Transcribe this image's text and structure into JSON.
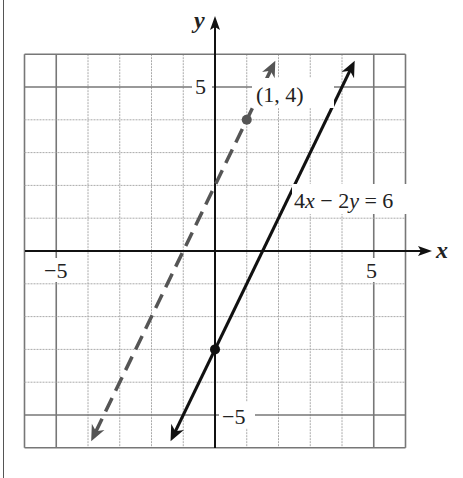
{
  "chart_data": {
    "type": "line",
    "title": "",
    "xlabel": "x",
    "ylabel": "y",
    "xlim": [
      -6,
      6
    ],
    "ylim": [
      -6,
      6
    ],
    "grid": true,
    "grid_step": 1,
    "major_grid_step": 5,
    "x_ticks_labeled": [
      -5,
      5
    ],
    "y_ticks_labeled": [
      5,
      -5
    ],
    "tick_labels": {
      "x_neg5": "−5",
      "x_pos5": "5",
      "y_pos5": "5",
      "y_neg5": "−5"
    },
    "series": [
      {
        "name": "4x − 2y = 6",
        "equation": "y = 2x − 3",
        "style": "solid",
        "color": "#111111",
        "x": [
          -1.4,
          4.4
        ],
        "y": [
          -5.8,
          5.8
        ],
        "marked_points": [
          [
            0,
            -3
          ]
        ]
      },
      {
        "name": "parallel through (1, 4)",
        "equation": "y = 2x + 2",
        "style": "dashed",
        "color": "#555555",
        "x": [
          -3.9,
          1.9
        ],
        "y": [
          -5.8,
          5.8
        ],
        "marked_points": [
          [
            1,
            4
          ]
        ]
      }
    ],
    "annotations": [
      {
        "text": "(1, 4)",
        "x": 1,
        "y": 4
      },
      {
        "text": "4x − 2y = 6",
        "x": 2.5,
        "y": 1.6
      }
    ]
  },
  "labels": {
    "x_axis": "x",
    "y_axis": "y",
    "x_neg5": "−5",
    "x_pos5": "5",
    "y_pos5": "5",
    "y_neg5": "−5",
    "point_label": "(1, 4)",
    "eq_a": "4",
    "eq_x": "x",
    "eq_mid": " − 2",
    "eq_y": "y",
    "eq_end": " = 6"
  }
}
